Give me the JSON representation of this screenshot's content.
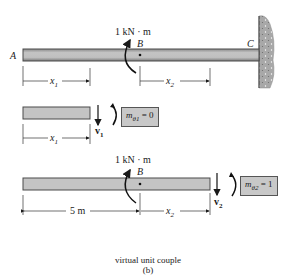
{
  "figure": {
    "caption_line1": "virtual unit couple",
    "caption_line2": "(b)"
  },
  "top_beam": {
    "moment_label": "1 kN · m",
    "point_a": "A",
    "point_b": "B",
    "point_c": "C",
    "dim_x1": "x",
    "dim_x1_sub": "1",
    "dim_x2": "x",
    "dim_x2_sub": "2"
  },
  "segment_1": {
    "shear_label": "v",
    "shear_sub": "1",
    "moment_box": "m",
    "moment_box_sub": "θ1",
    "moment_box_value": "= 0",
    "dim_x1": "x",
    "dim_x1_sub": "1"
  },
  "segment_2": {
    "moment_label": "1 kN · m",
    "point_b": "B",
    "shear_label": "v",
    "shear_sub": "2",
    "moment_box": "m",
    "moment_box_sub": "θ2",
    "moment_box_value": "= 1",
    "dim_5m": "5 m",
    "dim_x2": "x",
    "dim_x2_sub": "2"
  },
  "colors": {
    "beam_fill": "#bdbdbd",
    "beam_edge": "#4a4a4a",
    "wall_fill": "#b0b0b0",
    "box_fill": "#c8c8c8"
  }
}
